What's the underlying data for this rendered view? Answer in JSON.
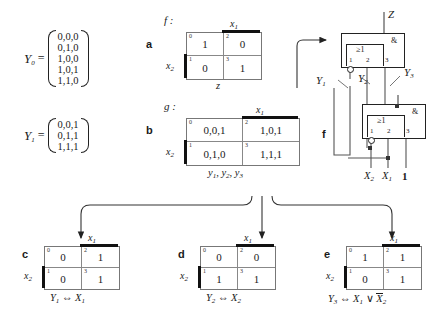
{
  "sets": [
    {
      "name": "Y",
      "sub": "0",
      "rows": [
        "0,0,0",
        "0,1,0",
        "1,0,0",
        "1,0,1",
        "1,1,0"
      ]
    },
    {
      "name": "Y",
      "sub": "1",
      "rows": [
        "0,0,1",
        "0,1,1",
        "1,1,1"
      ]
    }
  ],
  "kmaps": {
    "a": {
      "letter": "a",
      "function_label": "f :",
      "col_var": "x",
      "col_var_sub": "1",
      "row_var": "x",
      "row_var_sub": "2",
      "indices": [
        "0",
        "2",
        "1",
        "3"
      ],
      "cells": [
        "1",
        "0",
        "0",
        "1"
      ],
      "bottom_label": "z"
    },
    "b": {
      "letter": "b",
      "function_label": "g :",
      "col_var": "x",
      "col_var_sub": "1",
      "row_var": "x",
      "row_var_sub": "2",
      "indices": [
        "0",
        "2",
        "1",
        "3"
      ],
      "cells": [
        "0,0,1",
        "1,0,1",
        "0,1,0",
        "1,1,1"
      ],
      "bottom_label": "y1 , y2 , y3"
    },
    "c": {
      "letter": "c",
      "col_var": "x",
      "col_var_sub": "1",
      "row_var": "x",
      "row_var_sub": "2",
      "indices": [
        "0",
        "2",
        "1",
        "3"
      ],
      "cells": [
        "0",
        "1",
        "0",
        "1"
      ],
      "caption_lhs": "Y",
      "caption_lhs_sub": "1",
      "caption_op": "⇔",
      "caption_rhs": "X",
      "caption_rhs_sub": "1"
    },
    "d": {
      "letter": "d",
      "col_var": "x",
      "col_var_sub": "1",
      "row_var": "x",
      "row_var_sub": "2",
      "indices": [
        "0",
        "2",
        "1",
        "3"
      ],
      "cells": [
        "0",
        "0",
        "1",
        "1"
      ],
      "caption_lhs": "Y",
      "caption_lhs_sub": "2",
      "caption_op": "⇔",
      "caption_rhs": "X",
      "caption_rhs_sub": "2"
    },
    "e": {
      "letter": "e",
      "col_var": "x",
      "col_var_sub": "1",
      "row_var": "x",
      "row_var_sub": "2",
      "indices": [
        "0",
        "2",
        "1",
        "3"
      ],
      "cells": [
        "1",
        "1",
        "0",
        "1"
      ],
      "caption_lhs": "Y",
      "caption_lhs_sub": "3",
      "caption_op": "⇔",
      "caption_rhs": "X",
      "caption_rhs_sub": "1",
      "caption_or": "∨",
      "caption_rhs2": "X",
      "caption_rhs2_sub": "2"
    }
  },
  "circuit": {
    "letter": "f",
    "output_label": "Z",
    "gates": [
      {
        "id": "gate-top",
        "and_symbol": "&",
        "or_symbol": "≥1",
        "pins": [
          "1",
          "2",
          "3"
        ]
      },
      {
        "id": "gate-bottom",
        "and_symbol": "&",
        "or_symbol": "≥1",
        "pins": [
          "1",
          "2",
          "3"
        ]
      }
    ],
    "signal_labels": [
      {
        "name": "Y",
        "sub": "1"
      },
      {
        "name": "Y",
        "sub": "2"
      },
      {
        "name": "Y",
        "sub": "3"
      }
    ],
    "inputs": [
      {
        "name": "X",
        "sub": "2",
        "italic": true
      },
      {
        "name": "X",
        "sub": "1",
        "italic": true
      },
      {
        "name": "1",
        "sub": "",
        "italic": false
      }
    ]
  }
}
